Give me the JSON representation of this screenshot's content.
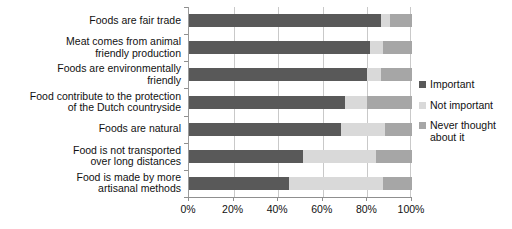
{
  "chart_data": {
    "type": "bar",
    "orientation": "horizontal",
    "stacked": true,
    "title": "",
    "xlabel": "",
    "ylabel": "",
    "xlim": [
      0,
      100
    ],
    "xticks": [
      "0%",
      "20%",
      "40%",
      "60%",
      "80%",
      "100%"
    ],
    "xtick_values": [
      0,
      20,
      40,
      60,
      80,
      100
    ],
    "grid": true,
    "legend_position": "right",
    "categories": [
      "Foods are fair trade",
      "Meat comes from animal friendly production",
      "Foods are environmentally friendly",
      "Food contribute to the protection of the Dutch countryside",
      "Foods are natural",
      "Food is not transported over long distances",
      "Food is made by more artisanal methods"
    ],
    "category_lines": [
      [
        "Foods are fair trade"
      ],
      [
        "Meat comes from animal",
        "friendly production"
      ],
      [
        "Foods are environmentally",
        "friendly"
      ],
      [
        "Food contribute to the protection",
        "of the Dutch countryside"
      ],
      [
        "Foods are natural"
      ],
      [
        "Food is not transported",
        "over long distances"
      ],
      [
        "Food is made by more",
        "artisanal methods"
      ]
    ],
    "series": [
      {
        "name": "Important",
        "color": "#595959",
        "values": [
          86,
          81,
          80,
          70,
          68,
          51,
          45
        ]
      },
      {
        "name": "Not important",
        "color": "#d9d9d9",
        "values": [
          4,
          6,
          6,
          10,
          20,
          33,
          42
        ]
      },
      {
        "name": "Never thought about it",
        "color": "#a6a6a6",
        "values": [
          10,
          13,
          14,
          20,
          12,
          16,
          13
        ]
      }
    ]
  },
  "legend": {
    "items": [
      {
        "label": "Important",
        "color": "#595959"
      },
      {
        "label": "Not important",
        "color": "#d9d9d9"
      },
      {
        "label": "Never thought about it",
        "color": "#a6a6a6"
      }
    ]
  }
}
